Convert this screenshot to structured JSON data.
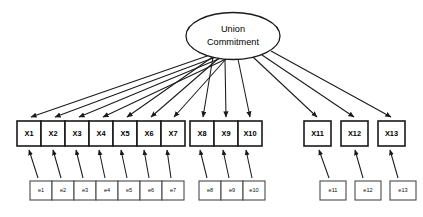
{
  "diagram": {
    "type": "sem-path-diagram",
    "title": "",
    "canvas": {
      "width": 423,
      "height": 217,
      "background": "#ffffff"
    },
    "latent": {
      "id": "union-commitment",
      "label_line1": "Union",
      "label_line2": "Commitment",
      "shape": "ellipse",
      "cx": 233,
      "cy": 36,
      "rx": 47,
      "ry": 23.5
    },
    "indicator_groups": [
      {
        "name": "group-1",
        "contiguous": true,
        "box_width": 24,
        "box_height": 25,
        "y": 121,
        "x_start": 17,
        "indicators": [
          {
            "id": "X1",
            "label": "X1",
            "x": 17
          },
          {
            "id": "X2",
            "label": "X2",
            "x": 41
          },
          {
            "id": "X3",
            "label": "X3",
            "x": 65
          },
          {
            "id": "X4",
            "label": "X4",
            "x": 89
          },
          {
            "id": "X5",
            "label": "X5",
            "x": 113
          },
          {
            "id": "X6",
            "label": "X6",
            "x": 137
          },
          {
            "id": "X7",
            "label": "X7",
            "x": 161
          }
        ]
      },
      {
        "name": "group-2",
        "contiguous": true,
        "box_width": 24,
        "box_height": 25,
        "y": 121,
        "x_start": 190,
        "indicators": [
          {
            "id": "X8",
            "label": "X8",
            "x": 190
          },
          {
            "id": "X9",
            "label": "X9",
            "x": 214
          },
          {
            "id": "X10",
            "label": "X10",
            "x": 238
          }
        ]
      },
      {
        "name": "group-3",
        "contiguous": false,
        "box_width": 27,
        "box_height": 25,
        "y": 121,
        "x_start": 304,
        "indicators": [
          {
            "id": "X11",
            "label": "X11",
            "x": 304
          },
          {
            "id": "X12",
            "label": "X12",
            "x": 341
          },
          {
            "id": "X13",
            "label": "X13",
            "x": 378
          }
        ]
      }
    ],
    "error_groups": [
      {
        "name": "error-group-1",
        "contiguous": true,
        "box_width": 22,
        "box_height": 19,
        "y": 181,
        "errors": [
          {
            "id": "e1",
            "label": "e1",
            "x": 30,
            "target": "X1"
          },
          {
            "id": "e2",
            "label": "e2",
            "x": 52,
            "target": "X2"
          },
          {
            "id": "e3",
            "label": "e3",
            "x": 74,
            "target": "X3"
          },
          {
            "id": "e4",
            "label": "e4",
            "x": 96,
            "target": "X4"
          },
          {
            "id": "e5",
            "label": "e5",
            "x": 118,
            "target": "X5"
          },
          {
            "id": "e6",
            "label": "e6",
            "x": 140,
            "target": "X6"
          },
          {
            "id": "e7",
            "label": "e7",
            "x": 162,
            "target": "X7"
          }
        ]
      },
      {
        "name": "error-group-2",
        "contiguous": true,
        "box_width": 22,
        "box_height": 19,
        "y": 181,
        "errors": [
          {
            "id": "e8",
            "label": "e8",
            "x": 199,
            "target": "X8"
          },
          {
            "id": "e9",
            "label": "e9",
            "x": 221,
            "target": "X9"
          },
          {
            "id": "e10",
            "label": "e10",
            "x": 243,
            "target": "X10"
          }
        ]
      },
      {
        "name": "error-group-3",
        "contiguous": false,
        "box_width": 26,
        "box_height": 19,
        "y": 181,
        "errors": [
          {
            "id": "e11",
            "label": "e11",
            "x": 320,
            "target": "X11"
          },
          {
            "id": "e12",
            "label": "e12",
            "x": 355,
            "target": "X12"
          },
          {
            "id": "e13",
            "label": "e13",
            "x": 390,
            "target": "X13"
          }
        ]
      }
    ],
    "factor_loadings": [
      {
        "from": "union-commitment",
        "to": "X1"
      },
      {
        "from": "union-commitment",
        "to": "X2"
      },
      {
        "from": "union-commitment",
        "to": "X3"
      },
      {
        "from": "union-commitment",
        "to": "X4"
      },
      {
        "from": "union-commitment",
        "to": "X5"
      },
      {
        "from": "union-commitment",
        "to": "X6"
      },
      {
        "from": "union-commitment",
        "to": "X7"
      },
      {
        "from": "union-commitment",
        "to": "X8"
      },
      {
        "from": "union-commitment",
        "to": "X9"
      },
      {
        "from": "union-commitment",
        "to": "X10"
      },
      {
        "from": "union-commitment",
        "to": "X11"
      },
      {
        "from": "union-commitment",
        "to": "X12"
      },
      {
        "from": "union-commitment",
        "to": "X13"
      }
    ],
    "colors": {
      "stroke": "#1a1a1a",
      "error_stroke": "#4a4a4a",
      "fill": "#ffffff",
      "text": "#000000"
    }
  }
}
